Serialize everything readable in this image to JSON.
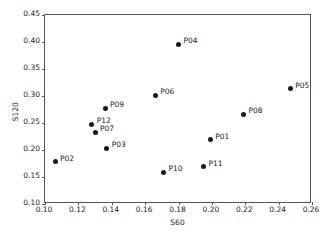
{
  "chart_data": {
    "type": "scatter",
    "title": "",
    "xlabel": "S60",
    "ylabel": "S120",
    "xlim": [
      0.1,
      0.26
    ],
    "ylim": [
      0.1,
      0.45
    ],
    "xticks": [
      "0.10",
      "0.12",
      "0.14",
      "0.16",
      "0.18",
      "0.20",
      "0.22",
      "0.24",
      "0.26"
    ],
    "yticks": [
      "0.10",
      "0.15",
      "0.20",
      "0.25",
      "0.30",
      "0.35",
      "0.40",
      "0.45"
    ],
    "grid": false,
    "legend": "none",
    "marker_color": "#1a1a1a",
    "axes_color": "#555555",
    "points": [
      {
        "label": "P02",
        "x": 0.106,
        "y": 0.178
      },
      {
        "label": "P12",
        "x": 0.128,
        "y": 0.248
      },
      {
        "label": "P07",
        "x": 0.13,
        "y": 0.233
      },
      {
        "label": "P09",
        "x": 0.136,
        "y": 0.277
      },
      {
        "label": "P03",
        "x": 0.137,
        "y": 0.203
      },
      {
        "label": "P06",
        "x": 0.166,
        "y": 0.301
      },
      {
        "label": "P10",
        "x": 0.171,
        "y": 0.159
      },
      {
        "label": "P04",
        "x": 0.18,
        "y": 0.396
      },
      {
        "label": "P11",
        "x": 0.195,
        "y": 0.169
      },
      {
        "label": "P01",
        "x": 0.199,
        "y": 0.219
      },
      {
        "label": "P08",
        "x": 0.219,
        "y": 0.266
      },
      {
        "label": "P05",
        "x": 0.247,
        "y": 0.313
      }
    ]
  }
}
